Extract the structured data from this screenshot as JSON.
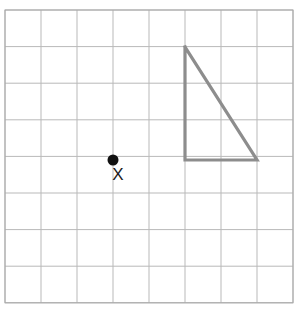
{
  "figure": {
    "type": "geometry-grid-diagram",
    "canvas": {
      "width": 300,
      "height": 318,
      "background": "#ffffff"
    },
    "grid": {
      "origin_x": 5,
      "origin_y": 10,
      "cell_width": 36,
      "cell_height": 36.6,
      "columns": 8,
      "rows": 8,
      "line_color": "#b9b9b9",
      "border_color": "#a8a8a8",
      "line_width": 1,
      "style": "solid-thin"
    },
    "shapes": [
      {
        "name": "right-triangle",
        "kind": "polygon",
        "stroke_color": "#8d8d8d",
        "stroke_width": 3.2,
        "fill": "none",
        "grid_vertices": [
          [
            5,
            1
          ],
          [
            5,
            4
          ],
          [
            7,
            4
          ]
        ],
        "pixel_vertices": [
          [
            185,
            47
          ],
          [
            185,
            160
          ],
          [
            257,
            160
          ]
        ],
        "legs": {
          "vertical": 3,
          "horizontal": 2
        }
      }
    ],
    "points": [
      {
        "name": "point-x",
        "label": "X",
        "grid_position": [
          3,
          4
        ],
        "pixel_position": [
          113,
          160
        ],
        "radius": 5.5,
        "color": "#111111",
        "label_color": "#1a1a1a",
        "label_pixel_position": [
          118,
          180
        ],
        "label_font_size": 17
      }
    ]
  },
  "chart_data": {
    "type": "scatter",
    "xlabel": "",
    "ylabel": "",
    "xlim": [
      0,
      8
    ],
    "ylim": [
      0,
      8
    ],
    "grid": true,
    "legend": "none",
    "categories": [],
    "series": [
      {
        "name": "point-x",
        "x": [
          3
        ],
        "y": [
          4
        ],
        "labels": [
          "X"
        ]
      },
      {
        "name": "right-triangle",
        "x": [
          5,
          5,
          7,
          5
        ],
        "y": [
          1,
          4,
          4,
          1
        ],
        "labels": []
      }
    ],
    "annotations": [
      "X"
    ]
  }
}
